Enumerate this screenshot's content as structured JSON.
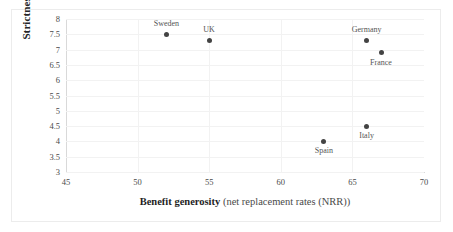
{
  "chart_data": {
    "type": "scatter",
    "title": "",
    "xlabel_bold": "Benefit generosity",
    "xlabel_rest": " (net replacement rates (NRR))",
    "ylabel": "Strictness of conditions",
    "xlim": [
      45,
      70
    ],
    "ylim": [
      3,
      8
    ],
    "xticks": [
      "45",
      "50",
      "55",
      "60",
      "65",
      "70"
    ],
    "xtick_values": [
      45,
      50,
      55,
      60,
      65,
      70
    ],
    "yticks": [
      "3",
      "3.5",
      "4",
      "4.5",
      "5",
      "5.5",
      "6",
      "6.5",
      "7",
      "7.5",
      "8"
    ],
    "ytick_values": [
      3,
      3.5,
      4,
      4.5,
      5,
      5.5,
      6,
      6.5,
      7,
      7.5,
      8
    ],
    "grid": true,
    "legend": "none",
    "marker_color": "#434343",
    "points": [
      {
        "label": "Sweden",
        "x": 52,
        "y": 7.5,
        "label_pos": "above"
      },
      {
        "label": "UK",
        "x": 55,
        "y": 7.3,
        "label_pos": "above"
      },
      {
        "label": "Germany",
        "x": 66,
        "y": 7.3,
        "label_pos": "above"
      },
      {
        "label": "France",
        "x": 67,
        "y": 6.9,
        "label_pos": "below"
      },
      {
        "label": "Italy",
        "x": 66,
        "y": 4.5,
        "label_pos": "below"
      },
      {
        "label": "Spain",
        "x": 63,
        "y": 4.0,
        "label_pos": "below"
      }
    ]
  },
  "colors": {
    "marker": "#434343",
    "grid": "#f2f2f2",
    "axis": "#d9d9d9",
    "frame": "#ececec",
    "text": "#4a4a4a",
    "title_text": "#1f1f1f"
  }
}
